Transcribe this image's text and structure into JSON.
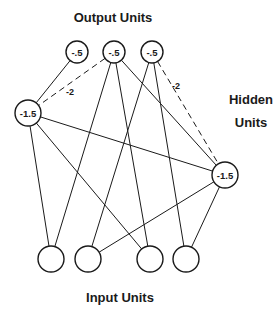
{
  "labels": {
    "output": "Output Units",
    "hidden_line1": "Hidden",
    "hidden_line2": "Units",
    "input": "Input Units"
  },
  "nodes": {
    "output": [
      {
        "id": "o1",
        "x": 77,
        "y": 52,
        "r": 11,
        "label": "-.5"
      },
      {
        "id": "o2",
        "x": 114,
        "y": 52,
        "r": 11,
        "label": "-.5"
      },
      {
        "id": "o3",
        "x": 152,
        "y": 52,
        "r": 11,
        "label": "-.5"
      }
    ],
    "hidden": [
      {
        "id": "h1",
        "x": 28,
        "y": 113,
        "r": 13,
        "label": "-1.5"
      },
      {
        "id": "h2",
        "x": 225,
        "y": 175,
        "r": 13,
        "label": "-1.5"
      }
    ],
    "input": [
      {
        "id": "i1",
        "x": 51,
        "y": 259,
        "r": 13,
        "label": ""
      },
      {
        "id": "i2",
        "x": 88,
        "y": 259,
        "r": 13,
        "label": ""
      },
      {
        "id": "i3",
        "x": 150,
        "y": 259,
        "r": 13,
        "label": ""
      },
      {
        "id": "i4",
        "x": 186,
        "y": 259,
        "r": 13,
        "label": ""
      }
    ]
  },
  "edges": [
    {
      "from": "o1",
      "to": "h1",
      "style": "solid"
    },
    {
      "from": "o2",
      "to": "h1",
      "style": "dashed",
      "weight": "-2"
    },
    {
      "from": "o3",
      "to": "h2",
      "style": "dashed",
      "weight": "-2"
    },
    {
      "from": "o2",
      "to": "h2",
      "style": "solid"
    },
    {
      "from": "o2",
      "to": "i1",
      "style": "solid"
    },
    {
      "from": "o2",
      "to": "i3",
      "style": "solid"
    },
    {
      "from": "o3",
      "to": "i2",
      "style": "solid"
    },
    {
      "from": "o3",
      "to": "i4",
      "style": "solid"
    },
    {
      "from": "h1",
      "to": "h2",
      "style": "solid"
    },
    {
      "from": "h1",
      "to": "i1",
      "style": "solid"
    },
    {
      "from": "h1",
      "to": "i3",
      "style": "solid"
    },
    {
      "from": "h2",
      "to": "i2",
      "style": "solid"
    },
    {
      "from": "h2",
      "to": "i4",
      "style": "solid"
    }
  ],
  "weight_labels": [
    {
      "text": "-2",
      "x": 66,
      "y": 95
    },
    {
      "text": "-2",
      "x": 172,
      "y": 89
    }
  ]
}
